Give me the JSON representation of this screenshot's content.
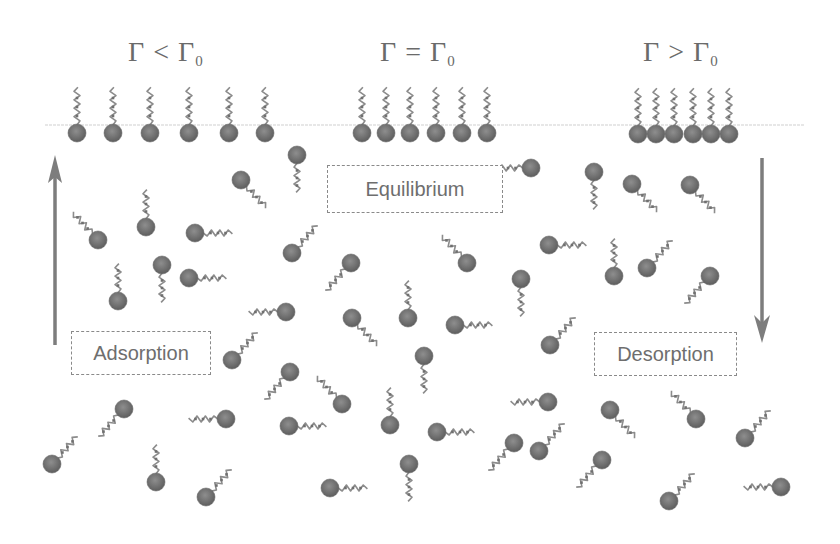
{
  "diagram": {
    "type": "surfactant adsorption/desorption schematic",
    "titles": [
      {
        "id": "under",
        "symbol": "Γ",
        "relation": "<",
        "ref": "Γ",
        "ref_sub": "0",
        "x": 128,
        "y": 40
      },
      {
        "id": "equal",
        "symbol": "Γ",
        "relation": "=",
        "ref": "Γ",
        "ref_sub": "0",
        "x": 380,
        "y": 40
      },
      {
        "id": "over",
        "symbol": "Γ",
        "relation": ">",
        "ref": "Γ",
        "ref_sub": "0",
        "x": 643,
        "y": 40
      }
    ],
    "labels": {
      "equilibrium": "Equilibrium",
      "adsorption": "Adsorption",
      "desorption": "Desorption"
    },
    "arrows": {
      "adsorption": {
        "direction": "up",
        "x": 55,
        "y_start": 345,
        "y_end": 155
      },
      "desorption": {
        "direction": "down",
        "x": 762,
        "y_start": 158,
        "y_end": 343
      }
    },
    "interface": {
      "y": 125,
      "x_start": 45,
      "x_end": 805
    },
    "colors": {
      "head": "#7a7a7a",
      "head_dark": "#5e5e5e",
      "tail": "#8c8c8c",
      "interface": "#cfcfcf",
      "arrow": "#7d7d7d",
      "text": "#6a6a6a",
      "box_border": "#8a8a8a"
    },
    "surface_groups": [
      {
        "name": "sparse",
        "heads_x": [
          77,
          113,
          150,
          189,
          229,
          265
        ],
        "y": 133
      },
      {
        "name": "monolayer",
        "heads_x": [
          362,
          386,
          410,
          436,
          462,
          487
        ],
        "y": 133
      },
      {
        "name": "crowded",
        "heads_x": [
          638,
          656,
          674,
          693,
          711,
          729
        ],
        "y": 134
      }
    ],
    "free_molecules": [
      {
        "x": 297,
        "y": 155,
        "tail": "down"
      },
      {
        "x": 241,
        "y": 180,
        "tail": "right-down"
      },
      {
        "x": 146,
        "y": 227,
        "tail": "up"
      },
      {
        "x": 98,
        "y": 240,
        "tail": "left-up"
      },
      {
        "x": 195,
        "y": 233,
        "tail": "right"
      },
      {
        "x": 292,
        "y": 253,
        "tail": "right-up"
      },
      {
        "x": 162,
        "y": 265,
        "tail": "down"
      },
      {
        "x": 189,
        "y": 278,
        "tail": "right"
      },
      {
        "x": 118,
        "y": 301,
        "tail": "up"
      },
      {
        "x": 286,
        "y": 312,
        "tail": "left"
      },
      {
        "x": 351,
        "y": 263,
        "tail": "left-down"
      },
      {
        "x": 408,
        "y": 318,
        "tail": "up"
      },
      {
        "x": 352,
        "y": 318,
        "tail": "right-down"
      },
      {
        "x": 455,
        "y": 325,
        "tail": "right"
      },
      {
        "x": 467,
        "y": 263,
        "tail": "left-up"
      },
      {
        "x": 521,
        "y": 279,
        "tail": "down"
      },
      {
        "x": 549,
        "y": 245,
        "tail": "right"
      },
      {
        "x": 531,
        "y": 168,
        "tail": "left"
      },
      {
        "x": 594,
        "y": 172,
        "tail": "down"
      },
      {
        "x": 632,
        "y": 184,
        "tail": "right-down"
      },
      {
        "x": 690,
        "y": 185,
        "tail": "right-down"
      },
      {
        "x": 614,
        "y": 276,
        "tail": "up"
      },
      {
        "x": 647,
        "y": 268,
        "tail": "right-up"
      },
      {
        "x": 710,
        "y": 276,
        "tail": "left-down"
      },
      {
        "x": 550,
        "y": 345,
        "tail": "right-up"
      },
      {
        "x": 232,
        "y": 360,
        "tail": "right-up"
      },
      {
        "x": 290,
        "y": 372,
        "tail": "left-down"
      },
      {
        "x": 424,
        "y": 356,
        "tail": "down"
      },
      {
        "x": 342,
        "y": 404,
        "tail": "left-up"
      },
      {
        "x": 390,
        "y": 425,
        "tail": "up"
      },
      {
        "x": 289,
        "y": 426,
        "tail": "right"
      },
      {
        "x": 124,
        "y": 409,
        "tail": "left-down"
      },
      {
        "x": 226,
        "y": 419,
        "tail": "left"
      },
      {
        "x": 52,
        "y": 464,
        "tail": "right-up"
      },
      {
        "x": 156,
        "y": 482,
        "tail": "up"
      },
      {
        "x": 206,
        "y": 497,
        "tail": "right-up"
      },
      {
        "x": 330,
        "y": 488,
        "tail": "right"
      },
      {
        "x": 409,
        "y": 464,
        "tail": "down"
      },
      {
        "x": 437,
        "y": 432,
        "tail": "right"
      },
      {
        "x": 548,
        "y": 402,
        "tail": "left"
      },
      {
        "x": 514,
        "y": 443,
        "tail": "left-down"
      },
      {
        "x": 539,
        "y": 451,
        "tail": "right-up"
      },
      {
        "x": 602,
        "y": 460,
        "tail": "left-down"
      },
      {
        "x": 610,
        "y": 410,
        "tail": "right-down"
      },
      {
        "x": 696,
        "y": 419,
        "tail": "left-up"
      },
      {
        "x": 745,
        "y": 438,
        "tail": "right-up"
      },
      {
        "x": 669,
        "y": 501,
        "tail": "right-up"
      },
      {
        "x": 781,
        "y": 487,
        "tail": "left"
      }
    ]
  }
}
